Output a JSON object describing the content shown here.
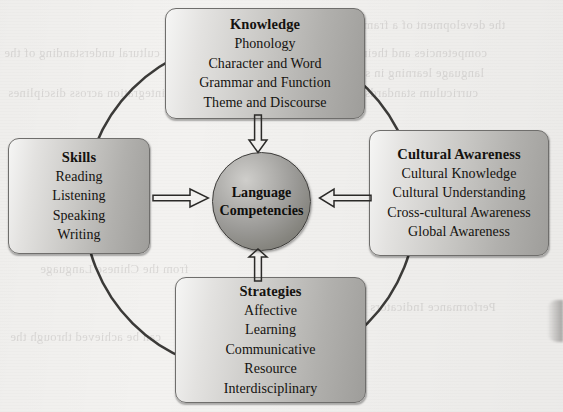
{
  "diagram": {
    "center": {
      "label_lines": [
        "Language",
        "Competencies"
      ],
      "shape": "circle"
    },
    "boxes": [
      {
        "id": "knowledge",
        "title": "Knowledge",
        "items": [
          "Phonology",
          "Character and Word",
          "Grammar and Function",
          "Theme and Discourse"
        ],
        "position": "top"
      },
      {
        "id": "skills",
        "title": "Skills",
        "items": [
          "Reading",
          "Listening",
          "Speaking",
          "Writing"
        ],
        "position": "left"
      },
      {
        "id": "cultural_awareness",
        "title": "Cultural Awareness",
        "items": [
          "Cultural Knowledge",
          "Cultural Understanding",
          "Cross-cultural Awareness",
          "Global Awareness"
        ],
        "position": "right"
      },
      {
        "id": "strategies",
        "title": "Strategies",
        "items": [
          "Affective",
          "Learning",
          "Communicative",
          "Resource",
          "Interdisciplinary"
        ],
        "position": "bottom"
      }
    ],
    "arrows": [
      {
        "id": "skills-to-center",
        "direction": "right",
        "style": "hollow"
      },
      {
        "id": "cultural-to-center",
        "direction": "left",
        "style": "hollow"
      },
      {
        "id": "knowledge-to-center",
        "direction": "down",
        "style": "hollow"
      },
      {
        "id": "strategies-to-center",
        "direction": "up",
        "style": "hollow"
      }
    ],
    "ring": {
      "shape": "circle",
      "style": "solid-outline"
    },
    "colors": {
      "page_background": "#f3f2f0",
      "box_fill_light": "#f6f6f5",
      "box_fill_dark": "#9e9d9a",
      "box_border": "#6f6e6c",
      "circle_fill_light": "#cfcecb",
      "circle_fill_dark": "#6f6e69",
      "text": "#14120f",
      "ring_stroke": "#3b3a38"
    }
  },
  "background_bleed": {
    "lines": [
      "the development of a framework",
      "competencies and their relation",
      "language learning in schools",
      "curriculum standards and the",
      "cultural understanding of the",
      "integration across disciplines",
      "from the Chinese Language",
      "can be achieved through the",
      "Performance Indicators"
    ]
  }
}
